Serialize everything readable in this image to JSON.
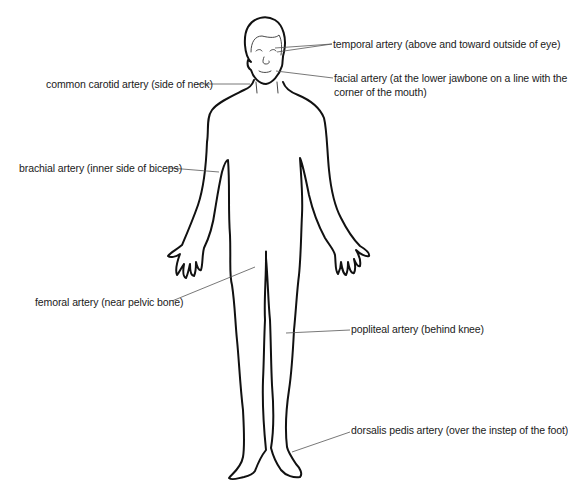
{
  "diagram": {
    "labels": {
      "temporal": "temporal artery (above and toward outside of eye)",
      "facial_line1": "facial artery (at the lower jawbone on a line with the",
      "facial_line2": "corner of the mouth)",
      "carotid": "common carotid artery (side of neck)",
      "brachial": "brachial artery (inner side of biceps)",
      "femoral": "femoral artery (near pelvic bone)",
      "popliteal": "popliteal artery (behind knee)",
      "dorsalis": "dorsalis pedis artery (over the instep of the foot)"
    },
    "colors": {
      "background": "#ffffff",
      "outline": "#111111",
      "text": "#1a1a1a",
      "leader": "#555555"
    }
  }
}
